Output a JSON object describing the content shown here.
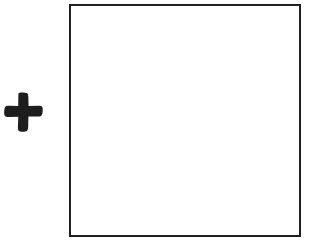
{
  "figure": {
    "width": 310,
    "height": 242,
    "background_color": "#ffffff",
    "ink_color": "#242424"
  },
  "operator": {
    "name": "plus",
    "symbol": "+",
    "label": "plus sign",
    "color": "#1d1d1d",
    "left": 4,
    "top": 92,
    "width": 39,
    "height": 40,
    "arm_thickness": 11,
    "center_x": 23,
    "center_y": 112
  },
  "shape": {
    "name": "square",
    "label": "empty square",
    "fill": "#ffffff",
    "stroke": "#242424",
    "stroke_width": 2,
    "left": 69,
    "top": 4,
    "width": 232,
    "height": 233,
    "contents": ""
  }
}
